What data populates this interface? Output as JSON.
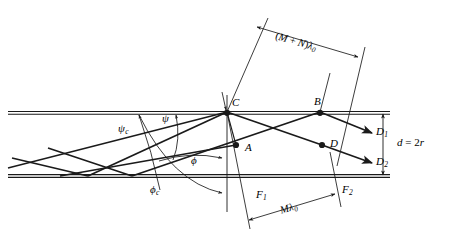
{
  "figure": {
    "background_color": "#ffffff",
    "line_color": "#1a1a1a",
    "text_color": "#000000"
  },
  "points": [
    {
      "id": "C",
      "label": "C",
      "x": 227,
      "y": 112
    },
    {
      "id": "B",
      "label": "B",
      "x": 320,
      "y": 112
    },
    {
      "id": "A",
      "label": "A",
      "x": 236,
      "y": 145
    },
    {
      "id": "D",
      "label": "D",
      "x": 322,
      "y": 145
    }
  ],
  "ray_labels": [
    {
      "id": "D1",
      "base": "D",
      "sub": "1"
    },
    {
      "id": "D2",
      "base": "D",
      "sub": "2"
    }
  ],
  "wavefront_labels": [
    {
      "id": "F1",
      "base": "F",
      "sub": "1"
    },
    {
      "id": "F2",
      "base": "F",
      "sub": "2"
    }
  ],
  "angles": [
    {
      "id": "psi_c",
      "base": "ψ",
      "sub": "c",
      "x": 124,
      "y": 126
    },
    {
      "id": "psi",
      "base": "ψ",
      "sub": "",
      "x": 166,
      "y": 119
    },
    {
      "id": "phi",
      "base": "ϕ",
      "sub": "",
      "x": 196,
      "y": 159
    },
    {
      "id": "phi_c",
      "base": "ϕ",
      "sub": "c",
      "x": 155,
      "y": 189
    }
  ],
  "dimensions": {
    "upper": {
      "id": "upper-path-difference",
      "prefix": "(",
      "m": "M",
      "plus": " + ",
      "n": "N",
      "suffix": ")",
      "lambda": "λ",
      "lambda_sub": "0",
      "text": "(M + N)λ0"
    },
    "lower": {
      "id": "lower-path-difference",
      "m": "M",
      "lambda": "λ",
      "lambda_sub": "0",
      "text": "Mλ0"
    }
  },
  "thickness": {
    "id": "guide-thickness",
    "d": "d",
    "equals": " = ",
    "value": "2",
    "r": "r",
    "text": "d = 2r"
  },
  "boundaries": {
    "top_y": 113,
    "bottom_y": 176,
    "left_x": 8,
    "right_x": 390
  }
}
